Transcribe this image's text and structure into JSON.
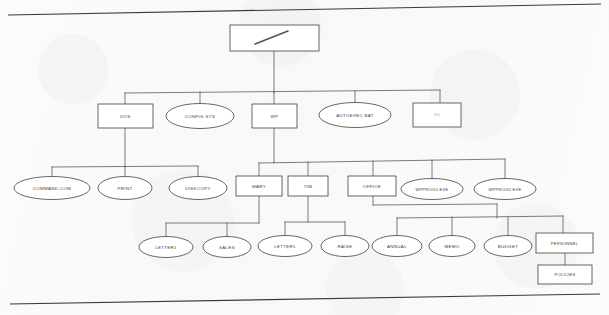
{
  "document": {
    "title": "DOS Directory Tree Diagram",
    "kind": "scanned-figure",
    "ink_color": "#4b4b4b",
    "paper_color": "#fbfbfa"
  },
  "page_rules": {
    "top": {
      "name": "top-page-edge"
    },
    "bottom": {
      "name": "bottom-page-edge"
    }
  },
  "root": {
    "label": "\\",
    "shape": "rect",
    "name": "root-directory-node"
  },
  "nodes": [
    {
      "id": "dos",
      "label": "DOS",
      "shape": "rect"
    },
    {
      "id": "configsys",
      "label": "CONFIG.SYS",
      "shape": "ellipse"
    },
    {
      "id": "wp",
      "label": "WP",
      "shape": "rect"
    },
    {
      "id": "autoexec",
      "label": "AUTOEXEC.BAT",
      "shape": "ellipse"
    },
    {
      "id": "ss",
      "label": "SS",
      "shape": "rect"
    },
    {
      "id": "commandcom",
      "label": "COMMAND.COM",
      "shape": "ellipse"
    },
    {
      "id": "print",
      "label": "PRINT",
      "shape": "ellipse"
    },
    {
      "id": "diskcopy",
      "label": "DISKCOPY",
      "shape": "ellipse"
    },
    {
      "id": "mary",
      "label": "MARY",
      "shape": "rect"
    },
    {
      "id": "tim",
      "label": "TIM",
      "shape": "rect"
    },
    {
      "id": "office",
      "label": "OFFICE",
      "shape": "rect"
    },
    {
      "id": "wpprog1",
      "label": "WPPROG1.EXE",
      "shape": "ellipse"
    },
    {
      "id": "wpprog2",
      "label": "WPPROG2.EXE",
      "shape": "ellipse"
    },
    {
      "id": "letter1a",
      "label": "LETTER1",
      "shape": "ellipse"
    },
    {
      "id": "sales",
      "label": "SALES",
      "shape": "ellipse"
    },
    {
      "id": "letter1b",
      "label": "LETTER1",
      "shape": "ellipse"
    },
    {
      "id": "raise",
      "label": "RAISE",
      "shape": "ellipse"
    },
    {
      "id": "annual",
      "label": "ANNUAL",
      "shape": "ellipse"
    },
    {
      "id": "memo",
      "label": "MEMO",
      "shape": "ellipse"
    },
    {
      "id": "budget",
      "label": "BUDGET",
      "shape": "ellipse"
    },
    {
      "id": "personnel",
      "label": "PERSONNEL",
      "shape": "rect"
    },
    {
      "id": "policies",
      "label": "POLICIES",
      "shape": "rect"
    }
  ],
  "edges": [
    {
      "from": "root",
      "to": "dos"
    },
    {
      "from": "root",
      "to": "configsys"
    },
    {
      "from": "root",
      "to": "wp"
    },
    {
      "from": "root",
      "to": "autoexec"
    },
    {
      "from": "root",
      "to": "ss"
    },
    {
      "from": "dos",
      "to": "commandcom"
    },
    {
      "from": "dos",
      "to": "print"
    },
    {
      "from": "dos",
      "to": "diskcopy"
    },
    {
      "from": "wp",
      "to": "mary"
    },
    {
      "from": "wp",
      "to": "tim"
    },
    {
      "from": "wp",
      "to": "office"
    },
    {
      "from": "wp",
      "to": "wpprog1"
    },
    {
      "from": "wp",
      "to": "wpprog2"
    },
    {
      "from": "mary",
      "to": "letter1a"
    },
    {
      "from": "mary",
      "to": "sales"
    },
    {
      "from": "tim",
      "to": "letter1b"
    },
    {
      "from": "tim",
      "to": "raise"
    },
    {
      "from": "office",
      "to": "annual"
    },
    {
      "from": "office",
      "to": "memo"
    },
    {
      "from": "office",
      "to": "budget"
    },
    {
      "from": "office",
      "to": "personnel"
    },
    {
      "from": "personnel",
      "to": "policies"
    }
  ]
}
